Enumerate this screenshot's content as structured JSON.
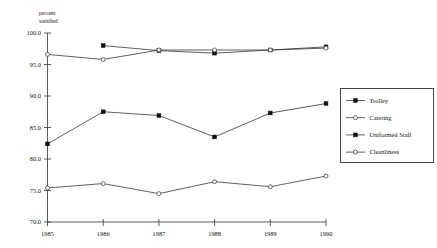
{
  "chart_data": {
    "type": "line",
    "title": "",
    "subtitle": "",
    "xlabel": "",
    "ylabel": "percent satisfied",
    "ylabel_line1": "percent",
    "ylabel_line2": "satisfied",
    "x": [
      1985,
      1986,
      1987,
      1988,
      1989,
      1990
    ],
    "categories": [
      "1985",
      "1986",
      "1987",
      "1988",
      "1989",
      "1990"
    ],
    "xtick_labels": [
      "1985",
      "1986",
      "1987",
      "1988",
      "1989",
      "1990"
    ],
    "ytick_labels": [
      "100.0",
      "95.0",
      "90.0",
      "85.0",
      "80.0",
      "75.0",
      "70.0"
    ],
    "ytick_values": [
      100.0,
      95.0,
      90.0,
      85.0,
      80.0,
      75.0,
      70.0
    ],
    "ylim": [
      70.0,
      100.0
    ],
    "xlim": [
      1985,
      1990
    ],
    "grid": false,
    "legend_position": "right",
    "series": [
      {
        "name": "Trolley",
        "marker": "filled-square",
        "values": [
          82.4,
          87.5,
          86.9,
          83.5,
          87.3,
          88.8
        ]
      },
      {
        "name": "Catering",
        "marker": "open-circle",
        "values": [
          75.4,
          76.1,
          74.5,
          76.4,
          75.6,
          77.3
        ]
      },
      {
        "name": "Uniformed Staff",
        "marker": "filled-square",
        "values": [
          null,
          98.0,
          97.2,
          96.8,
          97.3,
          97.8
        ]
      },
      {
        "name": "Cleanliness",
        "marker": "open-circle",
        "values": [
          96.6,
          95.8,
          97.3,
          97.3,
          97.3,
          97.6
        ]
      }
    ]
  },
  "legend": {
    "entries": [
      {
        "label": "Trolley",
        "marker": "filled-square"
      },
      {
        "label": "Catering",
        "marker": "open-circle"
      },
      {
        "label": "Uniformed Staff",
        "marker": "filled-square"
      },
      {
        "label": "Cleanliness",
        "marker": "open-circle"
      }
    ]
  },
  "colors": {
    "line": "#2b2b2b",
    "axis": "#4a4a4a",
    "marker_fill": "#111111",
    "marker_open_fill": "#ffffff",
    "background": "#ffffff"
  }
}
